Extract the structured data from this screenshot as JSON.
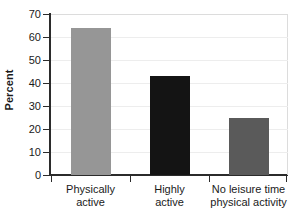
{
  "chart_data": {
    "type": "bar",
    "title": "",
    "xlabel": "",
    "ylabel": "Percent",
    "categories": [
      "Physically active",
      "Highly active",
      "No leisure time physical activity"
    ],
    "category_lines": [
      [
        "Physically",
        "active"
      ],
      [
        "Highly",
        "active"
      ],
      [
        "No leisure time",
        "physical activity"
      ]
    ],
    "values": [
      64,
      43,
      25
    ],
    "bar_colors": [
      "#969696",
      "#141414",
      "#5a5a5a"
    ],
    "ylim": [
      0,
      70
    ],
    "ytick_labels": [
      "0",
      "10",
      "20",
      "30",
      "40",
      "50",
      "60",
      "70"
    ],
    "ytick_values": [
      0,
      10,
      20,
      30,
      40,
      50,
      60,
      70
    ],
    "grid": true,
    "legend": "none",
    "axis_color": "#2b2b2b",
    "gridline_color": "#ededed",
    "background": "#ffffff"
  }
}
